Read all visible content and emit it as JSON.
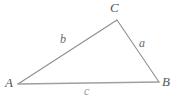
{
  "figure": {
    "name": "triangle-abc",
    "background_color": "#ffffff",
    "stroke_color": "#8c8c8c",
    "label_color": "#5a5a5a",
    "vertices": [
      {
        "id": "A",
        "label": "A",
        "x": 18,
        "y": 84
      },
      {
        "id": "B",
        "label": "B",
        "x": 159,
        "y": 82
      },
      {
        "id": "C",
        "label": "C",
        "x": 117,
        "y": 20
      }
    ],
    "sides": [
      {
        "id": "a",
        "label": "a",
        "from": "B",
        "to": "C"
      },
      {
        "id": "b",
        "label": "b",
        "from": "A",
        "to": "C"
      },
      {
        "id": "c",
        "label": "c",
        "from": "A",
        "to": "B"
      }
    ],
    "vertex_labels": {
      "A": "A",
      "B": "B",
      "C": "C"
    },
    "side_labels": {
      "a": "a",
      "b": "b",
      "c": "c"
    }
  }
}
